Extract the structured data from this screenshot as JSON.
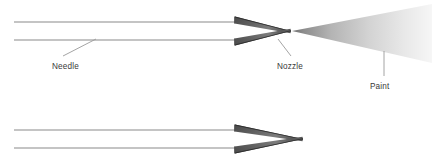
{
  "diagram": {
    "background_color": "#ffffff",
    "width": 432,
    "height": 158,
    "labels": {
      "needle": "Needle",
      "nozzle": "Nozzle",
      "paint": "Paint"
    },
    "colors": {
      "needle_line": "#8a8a8a",
      "nozzle_wedge_dark": "#3c3c3c",
      "nozzle_wedge_mid": "#6e6e6e",
      "nozzle_wedge_light": "#9a9a9a",
      "paint_spray_start": "#7d7d7d",
      "paint_spray_end": "#f2f2f2",
      "leader_line": "#9a9a9a",
      "label_text": "#3a3a3a"
    },
    "views": [
      {
        "name": "open-nozzle-spraying",
        "description": "Top view: needle retracted from nozzle, paint spraying as a fan",
        "needle_top_y": 22,
        "needle_bottom_y": 40,
        "needle_start_x": 14,
        "needle_end_x": 236,
        "nozzle_tip_x": 291,
        "nozzle_tip_y": 31
      },
      {
        "name": "closed-nozzle-sealed",
        "description": "Bottom view: needle seated fully into nozzle, no paint",
        "needle_top_y": 130,
        "needle_bottom_y": 148,
        "needle_start_x": 14,
        "needle_end_x": 236,
        "nozzle_tip_x": 303,
        "nozzle_tip_y": 139
      }
    ],
    "paint_spray": {
      "apex_x": 292,
      "apex_y": 31,
      "far_x": 432,
      "far_top_y": 4,
      "far_bottom_y": 63
    }
  }
}
